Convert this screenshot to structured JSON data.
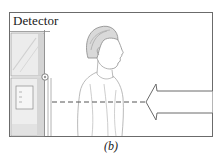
{
  "figure": {
    "detector_label": "Detector",
    "caption": "(b)",
    "elements": {
      "detector": "detector-booth",
      "person": "person-profile",
      "beam": "dashed-beam-line",
      "arrow": "incoming-arrow"
    },
    "colors": {
      "frame": "#6b6b6b",
      "line": "#555555",
      "sketch": "#9a9a9a",
      "fill": "#ffffff"
    }
  }
}
